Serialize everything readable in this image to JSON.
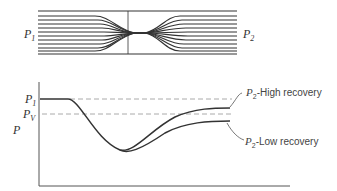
{
  "top_diagram": {
    "title": "Flow through an orifice / restriction",
    "inlet_label": "P",
    "inlet_sub": "1",
    "outlet_label": "P",
    "outlet_sub": "2",
    "streamline_count": 10
  },
  "pressure_plot": {
    "y_axis_label": "P",
    "p1_label": "P",
    "p1_sub": "1",
    "pv_label": "P",
    "pv_sub": "V",
    "high_recovery": {
      "symbol": "P",
      "sub": "2",
      "text": "-High recovery"
    },
    "low_recovery": {
      "symbol": "P",
      "sub": "2",
      "text": "-Low recovery"
    },
    "line_color": "#333333",
    "dash_color": "#aaaaaa"
  }
}
